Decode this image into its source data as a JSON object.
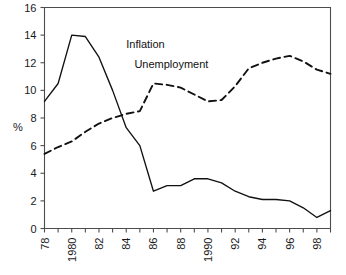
{
  "chart_data": {
    "type": "line",
    "title": "",
    "xlabel": "",
    "ylabel": "%",
    "xlim": [
      78,
      99
    ],
    "ylim": [
      0,
      16
    ],
    "grid": false,
    "legend": "inline-annotations",
    "x": [
      78,
      79,
      80,
      81,
      82,
      83,
      84,
      85,
      86,
      87,
      88,
      89,
      90,
      91,
      92,
      93,
      94,
      95,
      96,
      97,
      98,
      99
    ],
    "x_tick_labels": [
      "78",
      "",
      "1980",
      "",
      "82",
      "",
      "84",
      "",
      "86",
      "",
      "88",
      "",
      "1990",
      "",
      "92",
      "",
      "94",
      "",
      "96",
      "",
      "98",
      ""
    ],
    "y_tick_labels": [
      "0",
      "2",
      "4",
      "6",
      "8",
      "10",
      "12",
      "14",
      "16"
    ],
    "y_ticks": [
      0,
      2,
      4,
      6,
      8,
      10,
      12,
      14,
      16
    ],
    "series": [
      {
        "name": "Inflation",
        "style": "solid",
        "color": "#111111",
        "label_x": 84,
        "label_y": 13.1,
        "values": [
          9.2,
          10.5,
          14.0,
          13.9,
          12.4,
          10.0,
          7.3,
          6.0,
          2.7,
          3.1,
          3.1,
          3.6,
          3.6,
          3.3,
          2.7,
          2.3,
          2.1,
          2.1,
          2.0,
          1.5,
          0.8,
          1.3
        ]
      },
      {
        "name": "Unemployment",
        "style": "dashed",
        "color": "#111111",
        "label_x": 84.6,
        "label_y": 11.6,
        "values": [
          5.4,
          5.9,
          6.3,
          7.0,
          7.6,
          8.0,
          8.3,
          8.5,
          10.5,
          10.4,
          10.2,
          9.7,
          9.2,
          9.3,
          10.3,
          11.6,
          12.0,
          12.3,
          12.5,
          12.1,
          11.5,
          11.2
        ]
      }
    ]
  }
}
